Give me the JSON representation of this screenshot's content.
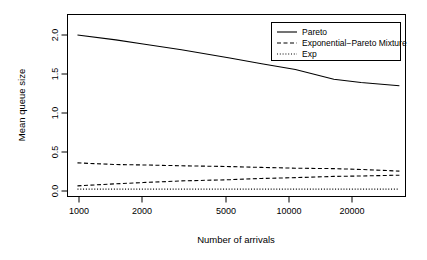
{
  "chart_data": {
    "type": "line",
    "title": "",
    "subtitle": "",
    "xlabel": "Number of arrivals",
    "ylabel": "Mean queue size",
    "x_scale": "log",
    "xlim": [
      900,
      32000
    ],
    "ylim": [
      -0.04,
      2.18
    ],
    "grid": false,
    "x_ticks": [
      1000,
      2000,
      5000,
      10000,
      20000
    ],
    "x_tick_labels": [
      "1000",
      "2000",
      "5000",
      "10000",
      "20000"
    ],
    "y_ticks": [
      0.0,
      0.5,
      1.0,
      1.5,
      2.0
    ],
    "y_tick_labels": [
      "0.0",
      "0.5",
      "1.0",
      "1.5",
      "2.0"
    ],
    "legend_position": "top-right",
    "series": [
      {
        "name": "Pareto",
        "style": "solid",
        "color": "#000000",
        "x": [
          1000,
          1500,
          2000,
          3000,
          5000,
          7000,
          10000,
          15000,
          20000,
          30000
        ],
        "values": [
          1.93,
          1.87,
          1.82,
          1.75,
          1.65,
          1.58,
          1.51,
          1.39,
          1.35,
          1.31
        ]
      },
      {
        "name": "Exponential-Pareto Mixture",
        "style": "dashed",
        "color": "#000000",
        "x": [
          1000,
          1500,
          2000,
          3000,
          5000,
          7000,
          10000,
          15000,
          20000,
          30000
        ],
        "values": [
          0.37,
          0.35,
          0.345,
          0.335,
          0.325,
          0.315,
          0.305,
          0.3,
          0.29,
          0.27
        ]
      },
      {
        "name": "Exponential-Pareto Mixture lower",
        "style": "dashed",
        "color": "#000000",
        "x": [
          1000,
          1500,
          2000,
          3000,
          5000,
          7000,
          10000,
          15000,
          20000,
          30000
        ],
        "values": [
          0.09,
          0.115,
          0.13,
          0.15,
          0.165,
          0.18,
          0.19,
          0.205,
          0.21,
          0.22
        ]
      },
      {
        "name": "Exp",
        "style": "dotted",
        "color": "#000000",
        "x": [
          1000,
          1500,
          2000,
          3000,
          5000,
          7000,
          10000,
          15000,
          20000,
          30000
        ],
        "values": [
          0.05,
          0.05,
          0.05,
          0.05,
          0.05,
          0.05,
          0.05,
          0.05,
          0.05,
          0.05
        ]
      }
    ],
    "legend_entries": [
      {
        "label": "Pareto",
        "style": "solid"
      },
      {
        "label": "Exponential−Pareto Mixture",
        "style": "dashed"
      },
      {
        "label": "Exp",
        "style": "dotted"
      }
    ]
  },
  "axes": {
    "x_label": "Number of arrivals",
    "y_label": "Mean queue size",
    "x_ticks": [
      "1000",
      "2000",
      "5000",
      "10000",
      "20000"
    ],
    "y_ticks": [
      "0.0",
      "0.5",
      "1.0",
      "1.5",
      "2.0"
    ]
  },
  "legend": {
    "items": [
      {
        "label": "Pareto"
      },
      {
        "label": "Exponential−Pareto Mixture"
      },
      {
        "label": "Exp"
      }
    ]
  },
  "colors": {
    "foreground": "#000000",
    "background": "#ffffff",
    "axis": "#000000"
  }
}
